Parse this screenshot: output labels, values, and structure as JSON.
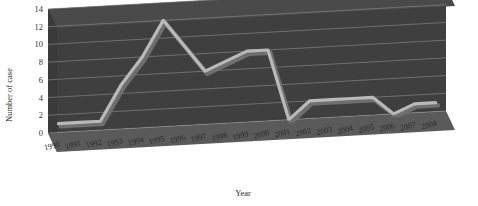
{
  "chart_data": {
    "type": "line",
    "title": "",
    "xlabel": "Year",
    "ylabel": "Number of case",
    "ylim": [
      0,
      14
    ],
    "ytick_values": [
      0,
      2,
      4,
      6,
      8,
      10,
      12,
      14
    ],
    "yticks": [
      "0",
      "2",
      "4",
      "6",
      "8",
      "10",
      "12",
      "14"
    ],
    "grid": true,
    "legend": "none",
    "three_d": true,
    "categories": [
      "1990",
      "1991",
      "1992",
      "1993",
      "1994",
      "1995",
      "1996",
      "1997",
      "1998",
      "1999",
      "2000",
      "2001",
      "2002",
      "2003",
      "2004",
      "2005",
      "2006",
      "2007",
      "2008"
    ],
    "values": [
      1,
      1,
      1,
      5,
      8,
      12,
      9,
      6,
      7,
      8,
      8,
      0,
      2,
      2,
      2,
      2,
      0,
      1,
      1
    ],
    "series": [
      {
        "name": "Number of case",
        "values": [
          1,
          1,
          1,
          5,
          8,
          12,
          9,
          6,
          7,
          8,
          8,
          0,
          2,
          2,
          2,
          2,
          0,
          1,
          1
        ]
      }
    ]
  },
  "colors": {
    "wall": "#4a4a4a",
    "wall_dark": "#3f3f3f",
    "floor": "#5a5a5a",
    "side": "#3a3a3a",
    "line": "#b9b9b9",
    "grid": "#8f8f8f",
    "text": "#2b2b2b",
    "background": "#ffffff"
  }
}
